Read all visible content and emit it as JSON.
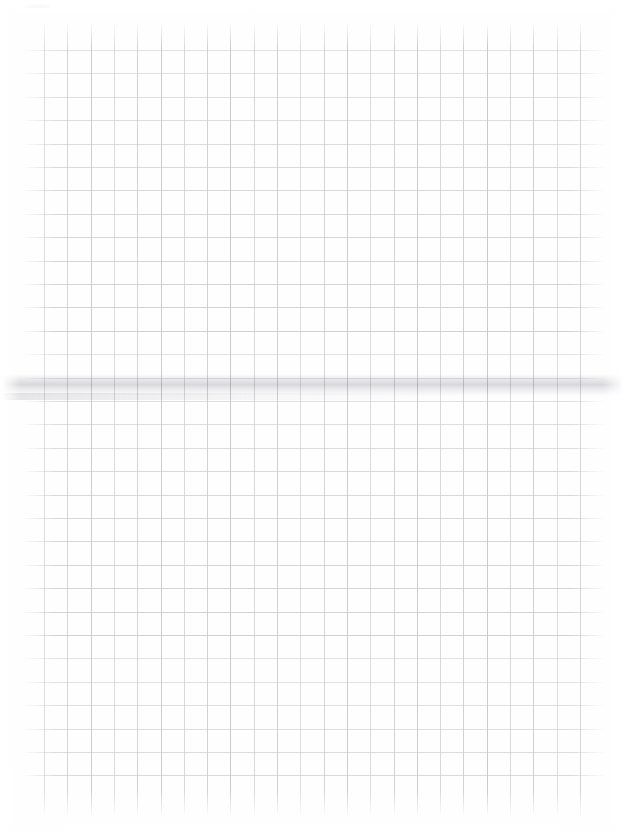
{
  "document": {
    "kind": "scanned-grid-paper",
    "page_width": 625,
    "page_height": 839,
    "background_color": "#fefefe",
    "text_content": "",
    "annotations": "",
    "notes_written": "none"
  },
  "grid": {
    "line_color_vertical": "#c9c9ce",
    "line_color_horizontal": "#cfcfd4",
    "cell_width": 23.3,
    "cell_height": 23.4,
    "vertical_line_count": 24,
    "horizontal_line_count": 32,
    "vertical_first_x": 44,
    "vertical_last_x": 580,
    "vertical_top_y": 22,
    "vertical_bottom_y": 816,
    "horizontal_first_y": 50,
    "horizontal_last_y": 793,
    "horizontal_left_x": 22,
    "horizontal_right_x": 605
  },
  "artifacts": {
    "scan_band": {
      "label": "horizontal scan/fold band",
      "top": 374,
      "height": 22,
      "color": "#b2b2ba"
    },
    "scan_band_secondary": {
      "label": "secondary scan streak",
      "top": 393,
      "color": "#afafb7"
    },
    "corner_smudge": {
      "label": "top-left corner smudge",
      "left": 24,
      "top": -3,
      "width": 26,
      "height": 11,
      "color": "#606068"
    }
  }
}
